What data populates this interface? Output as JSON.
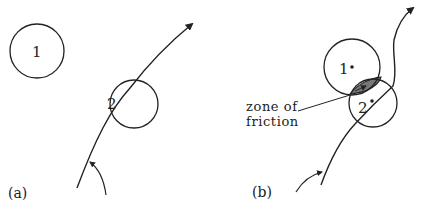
{
  "colors": {
    "stroke": "#222222",
    "zone_fill": "#777777",
    "background": "#ffffff"
  },
  "panel_a": {
    "caption": "(a)",
    "circle_1_label": "1",
    "circle_2_label": "2"
  },
  "panel_b": {
    "caption": "(b)",
    "circle_1_label": "1",
    "circle_2_label": "2",
    "annotation_line1": "zone of",
    "annotation_line2": "friction"
  }
}
